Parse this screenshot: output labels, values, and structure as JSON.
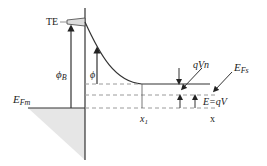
{
  "diagram": {
    "type": "band-diagram",
    "labels": {
      "te": "TE",
      "phi_b": "ϕ",
      "phi_b_sub": "B",
      "phi": "ϕ",
      "efm": "E",
      "efm_sub": "Fm",
      "efs": "E",
      "efs_sub": "Fs",
      "qvn": "qVn",
      "e_qv": "E=qV",
      "x1": "x",
      "x1_sub": "1",
      "x_axis": "x"
    },
    "colors": {
      "line": "#333333",
      "dashed": "#9a9a9a",
      "shade": "#e6e6e6"
    }
  }
}
